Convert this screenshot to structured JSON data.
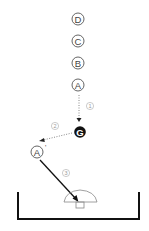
{
  "diagram": {
    "nodes": [
      {
        "id": "D",
        "label": "D",
        "x": 78,
        "y": 19
      },
      {
        "id": "C",
        "label": "C",
        "x": 78,
        "y": 41
      },
      {
        "id": "B",
        "label": "B",
        "x": 78,
        "y": 62
      },
      {
        "id": "A",
        "label": "A",
        "x": 78,
        "y": 85
      },
      {
        "id": "A_prime",
        "label": "A",
        "prime": "'",
        "x": 38,
        "y": 151
      }
    ],
    "goal": {
      "label": "G",
      "x": 80,
      "y": 134
    },
    "steps": [
      {
        "label": "1",
        "glyph": "①",
        "from": "A",
        "to": "G",
        "style": "dotted"
      },
      {
        "label": "2",
        "glyph": "②",
        "from": "G",
        "to": "A'",
        "style": "dotted"
      },
      {
        "label": "3",
        "glyph": "③",
        "from": "A'",
        "to": "mushroom",
        "style": "solid"
      }
    ],
    "target": {
      "name": "mushroom-stool"
    },
    "colors": {
      "stroke": "#111111",
      "dotted": "#888888",
      "circle": "#555555",
      "step_label": "#999999",
      "goal_fill": "#111111"
    }
  }
}
